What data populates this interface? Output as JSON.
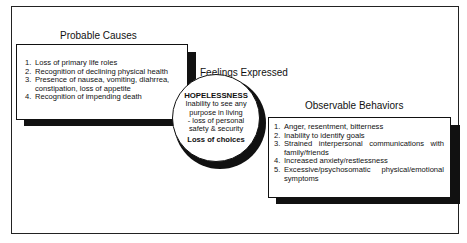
{
  "diagram": {
    "probable_causes": {
      "heading": "Probable Causes",
      "items": [
        {
          "num": "1.",
          "text": "Loss of primary life roles"
        },
        {
          "num": "2.",
          "text": "Recognition of declining physical health"
        },
        {
          "num": "3.",
          "text": "Presence of nausea, vomiting, diahrrea, constipation, loss of appetite"
        },
        {
          "num": "4.",
          "text": "Recognition of impending death"
        }
      ]
    },
    "feelings_expressed": {
      "heading": "Feelings Expressed",
      "title": "HOPELESSNESS",
      "lines": [
        "Inability to see any",
        "purpose in living",
        "- loss of personal",
        "safety & security"
      ],
      "footer": "Loss of choices"
    },
    "observable_behaviors": {
      "heading": "Observable Behaviors",
      "items": [
        {
          "num": "1.",
          "text": "Anger, resentment, bitterness"
        },
        {
          "num": "2.",
          "text": "Inability to identify goals"
        },
        {
          "num": "3.",
          "text": "Strained interpersonal communications with family/friends"
        },
        {
          "num": "4.",
          "text": "Increased anxiety/restlessness"
        },
        {
          "num": "5.",
          "text": "Excessive/psychosomatic physical/emotional symptoms"
        }
      ]
    }
  }
}
